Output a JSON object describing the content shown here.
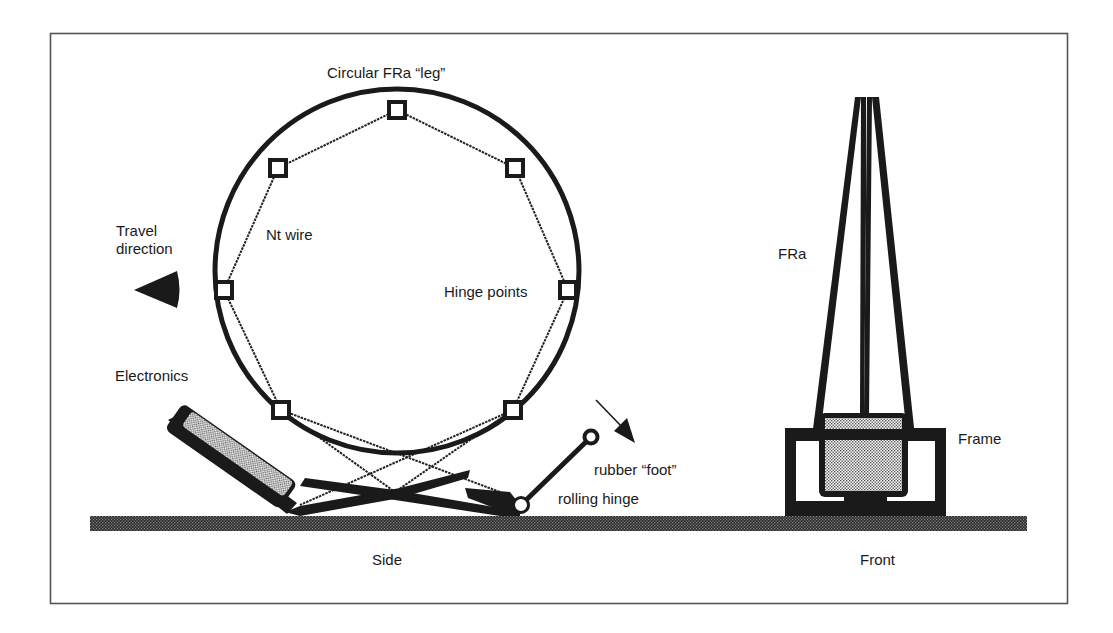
{
  "figure": {
    "border_color": "#555555",
    "ink_color": "#1a1a1a",
    "stipple_light": "#bdbdbd",
    "stipple_dark": "#3a3a3a"
  },
  "side_view": {
    "caption": "Side",
    "labels": {
      "circular_leg": "Circular FRa “leg”",
      "nt_wire": "Nt wire",
      "travel_direction_line1": "Travel",
      "travel_direction_line2": "direction",
      "hinge_points": "Hinge points",
      "electronics": "Electronics",
      "rubber_foot": "rubber “foot”",
      "rolling_hinge": "rolling hinge"
    },
    "hinge_point_count": 8
  },
  "front_view": {
    "caption": "Front",
    "labels": {
      "fra": "FRa",
      "frame": "Frame"
    }
  }
}
